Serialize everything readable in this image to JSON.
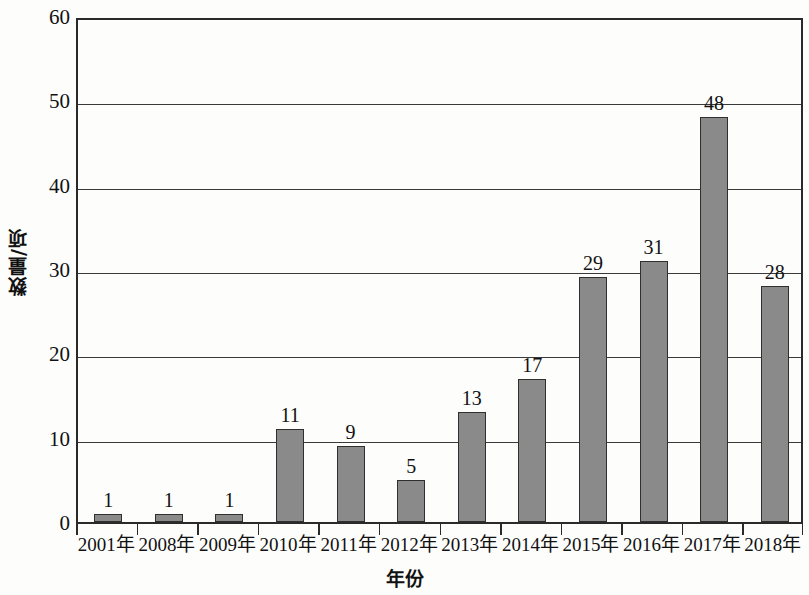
{
  "chart_data": {
    "type": "bar",
    "title": "",
    "xlabel": "年份",
    "ylabel": "数量/项",
    "categories": [
      "2001年",
      "2008年",
      "2009年",
      "2010年",
      "2011年",
      "2012年",
      "2013年",
      "2014年",
      "2015年",
      "2016年",
      "2017年",
      "2018年"
    ],
    "values": [
      1,
      1,
      1,
      11,
      9,
      5,
      13,
      17,
      29,
      31,
      48,
      28
    ],
    "data_labels": [
      "1",
      "1",
      "1",
      "11",
      "9",
      "5",
      "13",
      "17",
      "29",
      "31",
      "48",
      "28"
    ],
    "ylim": [
      0,
      60
    ],
    "y_ticks": [
      0,
      10,
      20,
      30,
      40,
      50,
      60
    ],
    "y_tick_labels": [
      "0",
      "10",
      "20",
      "30",
      "40",
      "50",
      "60"
    ],
    "grid": true,
    "grid_axis": "y",
    "legend": false,
    "legend_position": "none",
    "bar_color": "#8a8a8a",
    "bar_border_color": "#2f2f2f",
    "axis_color": "#2a2a2a",
    "background_color": "#fdfdfc"
  }
}
